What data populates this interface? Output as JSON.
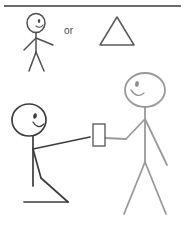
{
  "scene": {
    "title": "Stick figure illustration: handing over an item",
    "background_color": "#ffffff",
    "width": 185,
    "height": 229,
    "top_rule": {
      "name": "top-divider-line",
      "color": "#3a3a3a",
      "y": 6,
      "x1": 4,
      "x2": 181,
      "stroke_width": 1.6
    },
    "choice_label": {
      "text": "or",
      "color": "#4a4a4a",
      "font_size": 10
    },
    "figures": [
      {
        "id": "top-stick-figure",
        "label": "standing stick person",
        "color": "#4f4f4f",
        "stroke_width": 1.5,
        "head": {
          "cx": 36,
          "cy": 23,
          "rx": 9,
          "ry": 9.5
        },
        "eye": {
          "cx": 39,
          "cy": 21,
          "r": 1.6
        },
        "mouth": "smile",
        "spine": {
          "x1": 36,
          "y1": 33,
          "x2": 36,
          "y2": 52
        },
        "arms": [
          {
            "x1": 36,
            "y1": 38,
            "x2": 24,
            "y2": 50
          },
          {
            "x1": 36,
            "y1": 38,
            "x2": 53,
            "y2": 45
          }
        ],
        "legs": [
          {
            "x1": 36,
            "y1": 52,
            "x2": 29,
            "y2": 71
          },
          {
            "x1": 36,
            "y1": 52,
            "x2": 44,
            "y2": 71
          }
        ]
      },
      {
        "id": "alternative-triangle",
        "label": "triangle shape alternative",
        "color": "#5a5a5a",
        "stroke_width": 1.5,
        "points": "117,17 134,45 100,45"
      },
      {
        "id": "kneeling-stick-figure",
        "label": "kneeling stick person offering item",
        "color": "#3c3c3c",
        "stroke_width": 1.7,
        "head": {
          "cx": 29,
          "cy": 120,
          "rx": 17,
          "ry": 16
        },
        "eye": {
          "cx": 35,
          "cy": 116,
          "r": 2.1
        },
        "mouth": "smile",
        "spine": {
          "x1": 33,
          "y1": 136,
          "x2": 33,
          "y2": 185
        },
        "arm": {
          "x1": 33,
          "y1": 148,
          "x2": 88,
          "y2": 137
        },
        "thigh": {
          "x1": 33,
          "y1": 148,
          "x2": 41,
          "y2": 177
        },
        "shin": {
          "x1": 41,
          "y1": 177,
          "x2": 67,
          "y2": 201
        },
        "foot": {
          "x1": 25,
          "y1": 201,
          "x2": 67,
          "y2": 201
        }
      },
      {
        "id": "standing-stick-figure",
        "label": "standing stick person receiving item",
        "color": "#9a9a9a",
        "stroke_width": 1.8,
        "head": {
          "cx": 145,
          "cy": 90,
          "rx": 20,
          "ry": 17
        },
        "eye": {
          "cx": 137,
          "cy": 84,
          "r": 2.2
        },
        "mouth": "smile",
        "spine": {
          "x1": 145,
          "y1": 107,
          "x2": 145,
          "y2": 161
        },
        "left_arm_upper": {
          "x1": 145,
          "y1": 119,
          "x2": 127,
          "y2": 138
        },
        "left_arm_lower": {
          "x1": 127,
          "y1": 138,
          "x2": 106,
          "y2": 138
        },
        "right_arm": {
          "x1": 145,
          "y1": 119,
          "x2": 166,
          "y2": 164
        },
        "legs": [
          {
            "x1": 145,
            "y1": 161,
            "x2": 125,
            "y2": 213
          },
          {
            "x1": 145,
            "y1": 161,
            "x2": 165,
            "y2": 213
          }
        ]
      }
    ],
    "exchanged_object": {
      "id": "handed-item",
      "label": "card or phone being handed over",
      "color": "#6a6a6a",
      "stroke_width": 1.5,
      "x": 93,
      "y": 124,
      "width": 12,
      "height": 22
    }
  }
}
